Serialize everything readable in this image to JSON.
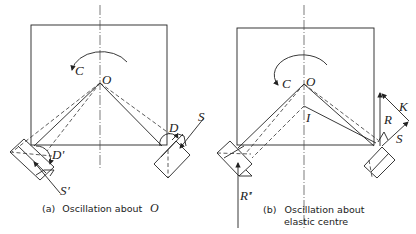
{
  "panels": [
    {
      "id": "a",
      "caption_prefix": "(a)",
      "caption_text": "Oscillation about",
      "caption_symbol": "O",
      "labels": {
        "couple": "C",
        "centre": "O",
        "right_displacement": "D",
        "left_displacement": "D'",
        "right_force": "S",
        "left_force": "S'"
      }
    },
    {
      "id": "b",
      "caption_prefix": "(b)",
      "caption_line1": "Oscillation about",
      "caption_line2": "elastic centre",
      "labels": {
        "couple": "C",
        "centre": "O",
        "elastic_centre": "I",
        "right_reaction": "R",
        "resultant": "K",
        "right_force": "S",
        "left_reaction": "R'"
      }
    }
  ],
  "colors": {
    "ink": "#222222",
    "background": "#ffffff"
  }
}
